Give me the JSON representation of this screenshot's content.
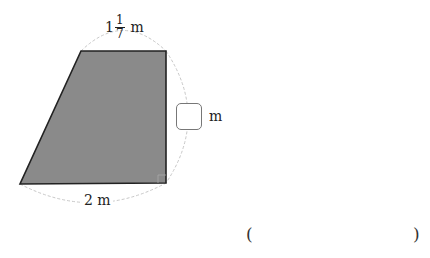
{
  "diagram": {
    "shape": "right trapezoid",
    "fill_color": "#8a8a8a",
    "stroke_color": "#222222",
    "dashed_arc_color": "#c8c8c8",
    "vertices": {
      "top_left": [
        81,
        51
      ],
      "top_right": [
        166,
        51
      ],
      "bottom_right": [
        166,
        183
      ],
      "bottom_left": [
        20,
        184
      ]
    },
    "right_angle_marker": "bottom-right corner"
  },
  "labels": {
    "top": {
      "whole": "1",
      "numerator": "1",
      "denominator": "7",
      "unit": "m"
    },
    "bottom": {
      "text": "2 m"
    },
    "right": {
      "unit": "m",
      "box_value": ""
    }
  },
  "answer": {
    "open_paren": "(",
    "close_paren": ")",
    "value": ""
  }
}
